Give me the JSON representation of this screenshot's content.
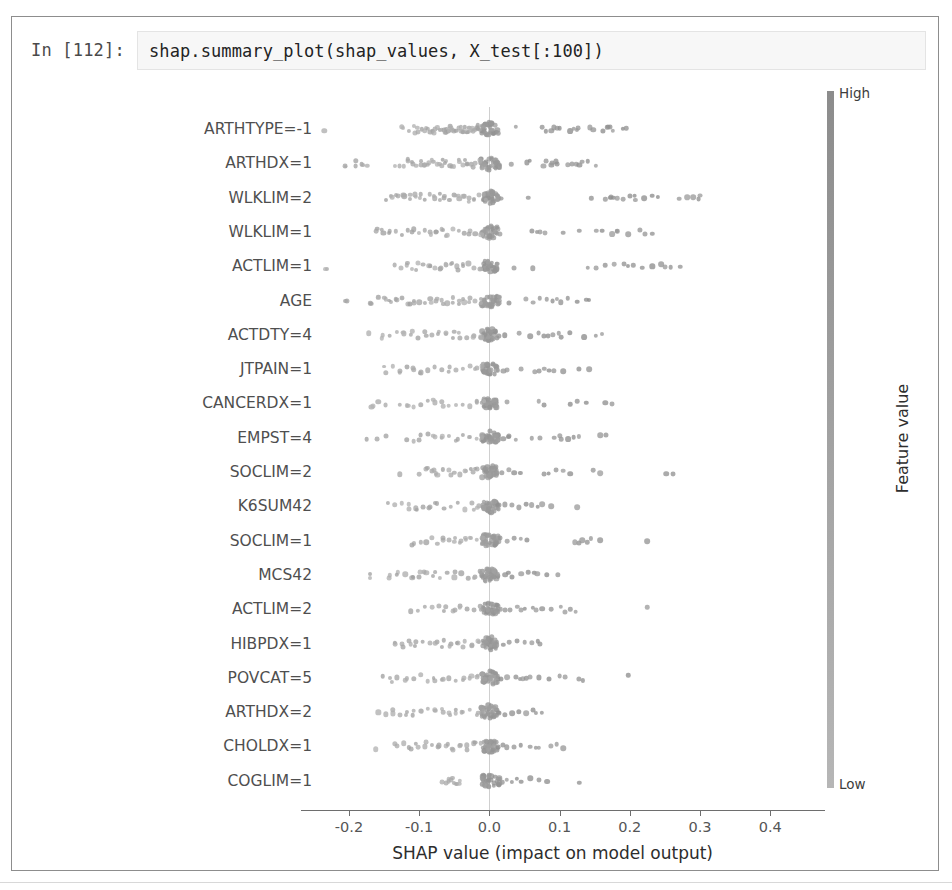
{
  "notebook": {
    "prompt_label": "In [112]:",
    "code": "shap.summary_plot(shap_values, X_test[:100])"
  },
  "chart_data": {
    "type": "scatter",
    "plot_kind": "shap-beeswarm-summary",
    "title": "",
    "xlabel": "SHAP value (impact on model output)",
    "ylabel": "",
    "xlim": [
      -0.26,
      0.47
    ],
    "xticks": [
      -0.2,
      -0.1,
      0.0,
      0.1,
      0.2,
      0.3,
      0.4
    ],
    "xticklabels": [
      "-0.2",
      "-0.1",
      "0.0",
      "0.1",
      "0.2",
      "0.3",
      "0.4"
    ],
    "grid": false,
    "zero_line": true,
    "n_samples_per_feature": 100,
    "colorbar": {
      "title": "Feature value",
      "high_label": "High",
      "low_label": "Low",
      "colormap": "grayscale",
      "high_color": "#8c8c8c",
      "low_color": "#b6b6b6",
      "position": "right"
    },
    "categories": [
      "ARTHTYPE=-1",
      "ARTHDX=1",
      "WLKLIM=2",
      "WLKLIM=1",
      "ACTLIM=1",
      "AGE",
      "ACTDTY=4",
      "JTPAIN=1",
      "CANCERDX=1",
      "EMPST=4",
      "SOCLIM=2",
      "K6SUM42",
      "SOCLIM=1",
      "MCS42",
      "ACTLIM=2",
      "HIBPDX=1",
      "POVCAT=5",
      "ARTHDX=2",
      "CHOLDX=1",
      "COGLIM=1"
    ],
    "series": [
      {
        "name": "ARTHTYPE=-1",
        "core_spread": 0.012,
        "left_tail": [
          -0.235,
          -0.125,
          -0.115,
          -0.108,
          -0.101,
          -0.096,
          -0.092,
          -0.088,
          -0.084,
          -0.081,
          -0.077,
          -0.074,
          -0.071,
          -0.068,
          -0.065,
          -0.062,
          -0.059,
          -0.056,
          -0.053,
          -0.05,
          -0.047,
          -0.044,
          -0.041,
          -0.038,
          -0.035,
          -0.032,
          -0.029,
          -0.026,
          -0.023,
          -0.02,
          -0.017,
          -0.014
        ],
        "right_tail": [
          0.038,
          0.075,
          0.088,
          0.092,
          0.096,
          0.1,
          0.115,
          0.12,
          0.126,
          0.143,
          0.148,
          0.162,
          0.168,
          0.172,
          0.19
        ]
      },
      {
        "name": "ARTHDX=1",
        "core_spread": 0.014,
        "left_tail": [
          -0.206,
          -0.19,
          -0.182,
          -0.174,
          -0.134,
          -0.128,
          -0.122,
          -0.116,
          -0.11,
          -0.104,
          -0.098,
          -0.092,
          -0.086,
          -0.08,
          -0.074,
          -0.068,
          -0.062,
          -0.056,
          -0.05,
          -0.044,
          -0.038,
          -0.032,
          -0.026,
          -0.02,
          -0.014,
          -0.008
        ],
        "right_tail": [
          0.031,
          0.053,
          0.077,
          0.081,
          0.089,
          0.095,
          0.112,
          0.118,
          0.124,
          0.132,
          0.152
        ]
      },
      {
        "name": "WLKLIM=2",
        "core_spread": 0.011,
        "left_tail": [
          -0.148,
          -0.14,
          -0.13,
          -0.121,
          -0.113,
          -0.106,
          -0.099,
          -0.092,
          -0.085,
          -0.078,
          -0.071,
          -0.064,
          -0.057,
          -0.05,
          -0.043,
          -0.036,
          -0.029,
          -0.022,
          -0.015,
          -0.008
        ],
        "right_tail": [
          0.012,
          0.055,
          0.145,
          0.165,
          0.172,
          0.182,
          0.19,
          0.2,
          0.208,
          0.22,
          0.232,
          0.24,
          0.27,
          0.282,
          0.29,
          0.3
        ]
      },
      {
        "name": "WLKLIM=1",
        "core_spread": 0.012,
        "left_tail": [
          -0.16,
          -0.151,
          -0.142,
          -0.133,
          -0.124,
          -0.116,
          -0.108,
          -0.1,
          -0.092,
          -0.084,
          -0.076,
          -0.068,
          -0.06,
          -0.052,
          -0.044,
          -0.036,
          -0.028,
          -0.02,
          -0.012
        ],
        "right_tail": [
          0.015,
          0.06,
          0.072,
          0.105,
          0.128,
          0.152,
          0.175,
          0.182,
          0.198,
          0.215,
          0.232
        ]
      },
      {
        "name": "ACTLIM=1",
        "core_spread": 0.011,
        "left_tail": [
          -0.232,
          -0.135,
          -0.126,
          -0.118,
          -0.11,
          -0.102,
          -0.094,
          -0.086,
          -0.078,
          -0.07,
          -0.062,
          -0.054,
          -0.046,
          -0.038,
          -0.03,
          -0.022,
          -0.014
        ],
        "right_tail": [
          0.035,
          0.062,
          0.14,
          0.152,
          0.165,
          0.178,
          0.192,
          0.205,
          0.218,
          0.232,
          0.245,
          0.258,
          0.272
        ]
      },
      {
        "name": "AGE",
        "core_spread": 0.013,
        "left_tail": [
          -0.205,
          -0.168,
          -0.158,
          -0.148,
          -0.14,
          -0.132,
          -0.124,
          -0.116,
          -0.108,
          -0.1,
          -0.092,
          -0.084,
          -0.076,
          -0.068,
          -0.06,
          -0.052,
          -0.044,
          -0.036,
          -0.028,
          -0.02,
          -0.012
        ],
        "right_tail": [
          0.028,
          0.052,
          0.062,
          0.072,
          0.082,
          0.09,
          0.102,
          0.112,
          0.125,
          0.138
        ]
      },
      {
        "name": "ACTDTY=4",
        "core_spread": 0.012,
        "left_tail": [
          -0.172,
          -0.152,
          -0.142,
          -0.132,
          -0.122,
          -0.112,
          -0.102,
          -0.092,
          -0.082,
          -0.072,
          -0.062,
          -0.052,
          -0.042,
          -0.032,
          -0.022,
          -0.012
        ],
        "right_tail": [
          0.022,
          0.042,
          0.058,
          0.07,
          0.078,
          0.09,
          0.102,
          0.115,
          0.135,
          0.152
        ]
      },
      {
        "name": "JTPAIN=1",
        "core_spread": 0.011,
        "left_tail": [
          -0.148,
          -0.138,
          -0.128,
          -0.118,
          -0.108,
          -0.098,
          -0.088,
          -0.078,
          -0.068,
          -0.058,
          -0.048,
          -0.038,
          -0.028,
          -0.018,
          -0.01
        ],
        "right_tail": [
          0.02,
          0.045,
          0.065,
          0.078,
          0.092,
          0.105,
          0.128,
          0.142
        ]
      },
      {
        "name": "CANCERDX=1",
        "core_spread": 0.01,
        "left_tail": [
          -0.168,
          -0.158,
          -0.148,
          -0.128,
          -0.118,
          -0.108,
          -0.098,
          -0.088,
          -0.078,
          -0.068,
          -0.058,
          -0.048,
          -0.038,
          -0.028,
          -0.018,
          -0.01
        ],
        "right_tail": [
          0.025,
          0.07,
          0.115,
          0.138,
          0.165
        ]
      },
      {
        "name": "EMPST=4",
        "core_spread": 0.012,
        "left_tail": [
          -0.175,
          -0.16,
          -0.148,
          -0.118,
          -0.108,
          -0.098,
          -0.088,
          -0.078,
          -0.068,
          -0.058,
          -0.048,
          -0.038,
          -0.028,
          -0.018,
          -0.01
        ],
        "right_tail": [
          0.012,
          0.02,
          0.028,
          0.038,
          0.06,
          0.072,
          0.092,
          0.1,
          0.112,
          0.12,
          0.158
        ]
      },
      {
        "name": "SOCLIM=2",
        "core_spread": 0.013,
        "left_tail": [
          -0.128,
          -0.1,
          -0.09,
          -0.082,
          -0.074,
          -0.066,
          -0.058,
          -0.05,
          -0.042,
          -0.034,
          -0.026,
          -0.018
        ],
        "right_tail": [
          0.018,
          0.028,
          0.035,
          0.078,
          0.095,
          0.105,
          0.115,
          0.148,
          0.158,
          0.252
        ]
      },
      {
        "name": "K6SUM42",
        "core_spread": 0.012,
        "left_tail": [
          -0.145,
          -0.135,
          -0.125,
          -0.115,
          -0.105,
          -0.095,
          -0.085,
          -0.075,
          -0.065,
          -0.055,
          -0.045,
          -0.035,
          -0.025,
          -0.015,
          -0.008
        ],
        "right_tail": [
          0.012,
          0.022,
          0.032,
          0.042,
          0.052,
          0.06,
          0.075,
          0.088,
          0.125
        ]
      },
      {
        "name": "SOCLIM=1",
        "core_spread": 0.012,
        "left_tail": [
          -0.108,
          -0.098,
          -0.09,
          -0.082,
          -0.074,
          -0.066,
          -0.058,
          -0.05,
          -0.042,
          -0.034,
          -0.026,
          -0.018,
          -0.01
        ],
        "right_tail": [
          0.015,
          0.025,
          0.035,
          0.045,
          0.122,
          0.132,
          0.145,
          0.158,
          0.225
        ]
      },
      {
        "name": "MCS42",
        "core_spread": 0.012,
        "left_tail": [
          -0.17,
          -0.142,
          -0.13,
          -0.12,
          -0.11,
          -0.1,
          -0.09,
          -0.08,
          -0.07,
          -0.06,
          -0.05,
          -0.04,
          -0.03,
          -0.02,
          -0.012
        ],
        "right_tail": [
          0.012,
          0.022,
          0.032,
          0.045,
          0.055,
          0.068,
          0.082,
          0.098
        ]
      },
      {
        "name": "ACTLIM=2",
        "core_spread": 0.011,
        "left_tail": [
          -0.112,
          -0.102,
          -0.092,
          -0.082,
          -0.072,
          -0.062,
          -0.052,
          -0.042,
          -0.032,
          -0.022,
          -0.012
        ],
        "right_tail": [
          0.012,
          0.022,
          0.03,
          0.04,
          0.05,
          0.062,
          0.075,
          0.088,
          0.102,
          0.115,
          0.225
        ]
      },
      {
        "name": "HIBPDX=1",
        "core_spread": 0.011,
        "left_tail": [
          -0.135,
          -0.125,
          -0.115,
          -0.105,
          -0.095,
          -0.085,
          -0.075,
          -0.065,
          -0.055,
          -0.045,
          -0.035,
          -0.025,
          -0.015
        ],
        "right_tail": [
          0.01,
          0.02,
          0.028,
          0.04,
          0.05,
          0.06,
          0.072
        ]
      },
      {
        "name": "POVCAT=5",
        "core_spread": 0.012,
        "left_tail": [
          -0.152,
          -0.142,
          -0.132,
          -0.118,
          -0.108,
          -0.098,
          -0.088,
          -0.078,
          -0.068,
          -0.058,
          -0.048,
          -0.038,
          -0.028,
          -0.018,
          -0.01
        ],
        "right_tail": [
          0.012,
          0.025,
          0.038,
          0.048,
          0.058,
          0.07,
          0.085,
          0.1,
          0.128,
          0.198
        ]
      },
      {
        "name": "ARTHDX=2",
        "core_spread": 0.013,
        "left_tail": [
          -0.158,
          -0.148,
          -0.138,
          -0.128,
          -0.118,
          -0.108,
          -0.098,
          -0.088,
          -0.078,
          -0.068,
          -0.058,
          -0.048,
          -0.038,
          -0.028,
          -0.018,
          -0.01
        ],
        "right_tail": [
          0.012,
          0.022,
          0.032,
          0.042,
          0.052,
          0.062,
          0.075
        ]
      },
      {
        "name": "CHOLDX=1",
        "core_spread": 0.011,
        "left_tail": [
          -0.162,
          -0.135,
          -0.122,
          -0.112,
          -0.102,
          -0.092,
          -0.082,
          -0.072,
          -0.062,
          -0.052,
          -0.042,
          -0.032,
          -0.022,
          -0.012
        ],
        "right_tail": [
          0.012,
          0.025,
          0.035,
          0.045,
          0.058,
          0.07,
          0.088,
          0.105
        ]
      },
      {
        "name": "COGLIM=1",
        "core_spread": 0.014,
        "left_tail": [
          -0.068,
          -0.062,
          -0.058,
          -0.054,
          -0.05,
          -0.046,
          -0.042
        ],
        "right_tail": [
          0.018,
          0.032,
          0.045,
          0.058,
          0.07,
          0.082,
          0.128
        ]
      }
    ]
  }
}
